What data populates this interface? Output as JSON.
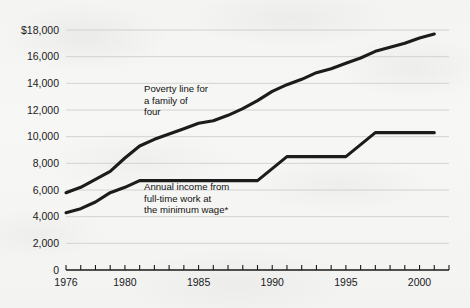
{
  "chart_data": {
    "type": "line",
    "title": "",
    "subtitle": "",
    "xlabel": "",
    "ylabel": "",
    "xlim": [
      1976,
      2002
    ],
    "ylim": [
      0,
      18000
    ],
    "grid": true,
    "legend_position": "inline-annotations",
    "y_ticks": [
      0,
      2000,
      4000,
      6000,
      8000,
      10000,
      12000,
      14000,
      16000,
      18000
    ],
    "y_tick_labels": [
      "0",
      "2,000",
      "4,000",
      "6,000",
      "8,000",
      "10,000",
      "12,000",
      "14,000",
      "16,000",
      "$18,000"
    ],
    "x_ticks": [
      1976,
      1977,
      1978,
      1979,
      1980,
      1981,
      1982,
      1983,
      1984,
      1985,
      1986,
      1987,
      1988,
      1989,
      1990,
      1991,
      1992,
      1993,
      1994,
      1995,
      1996,
      1997,
      1998,
      1999,
      2000,
      2001,
      2002
    ],
    "x_tick_labels": [
      {
        "value": 1976,
        "label": "1976"
      },
      {
        "value": 1980,
        "label": "1980"
      },
      {
        "value": 1985,
        "label": "1985"
      },
      {
        "value": 1990,
        "label": "1990"
      },
      {
        "value": 1995,
        "label": "1995"
      },
      {
        "value": 2000,
        "label": "2000"
      }
    ],
    "series": [
      {
        "name": "Poverty line for a family of four",
        "color": "#1c1c1c",
        "x": [
          1976,
          1977,
          1978,
          1979,
          1980,
          1981,
          1982,
          1983,
          1984,
          1985,
          1986,
          1987,
          1988,
          1989,
          1990,
          1991,
          1992,
          1993,
          1994,
          1995,
          1996,
          1997,
          1998,
          1999,
          2000,
          2001
        ],
        "values": [
          5800,
          6200,
          6800,
          7400,
          8400,
          9300,
          9800,
          10200,
          10600,
          11000,
          11200,
          11600,
          12100,
          12700,
          13400,
          13900,
          14300,
          14800,
          15100,
          15500,
          15900,
          16400,
          16700,
          17000,
          17400,
          17700
        ]
      },
      {
        "name": "Annual income from full-time work at the minimum wage*",
        "color": "#1c1c1c",
        "x": [
          1976,
          1977,
          1978,
          1979,
          1980,
          1981,
          1982,
          1983,
          1984,
          1985,
          1986,
          1987,
          1988,
          1989,
          1990,
          1991,
          1992,
          1993,
          1994,
          1995,
          1996,
          1997,
          1998,
          1999,
          2000,
          2001
        ],
        "values": [
          4300,
          4600,
          5100,
          5800,
          6200,
          6700,
          6700,
          6700,
          6700,
          6700,
          6700,
          6700,
          6700,
          6700,
          7600,
          8500,
          8500,
          8500,
          8500,
          8500,
          9400,
          10300,
          10300,
          10300,
          10300,
          10300
        ]
      }
    ],
    "annotations": [
      {
        "id": "poverty-line-label",
        "lines": [
          "Poverty line for",
          "a family of",
          "four"
        ],
        "x_px": 144,
        "y_px": 92
      },
      {
        "id": "minimum-wage-label",
        "lines": [
          "Annual income from",
          "full-time work at",
          "the minimum wage*"
        ],
        "x_px": 144,
        "y_px": 190
      }
    ]
  },
  "colors": {
    "background": "#f6f6f5",
    "line": "#1c1c1c",
    "gridline": "#c9c9c6",
    "axis": "#1a1a1a",
    "text": "#1a1a1a"
  }
}
